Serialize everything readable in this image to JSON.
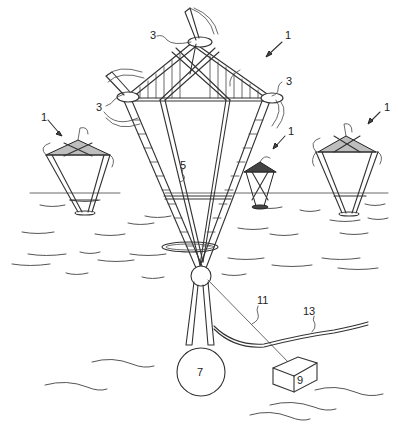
{
  "figure": {
    "type": "patent-drawing",
    "reference_labels": {
      "platform_main": "1",
      "platform_left": "1",
      "platform_center_small": "1",
      "platform_right": "1",
      "turbine_top": "3",
      "turbine_left": "3",
      "turbine_right": "3",
      "tower_truss": "5",
      "ballast": "7",
      "anchor_block": "9",
      "mooring_line": "11",
      "power_cable": "13"
    },
    "colors": {
      "line": "#333333",
      "background": "#ffffff"
    }
  }
}
